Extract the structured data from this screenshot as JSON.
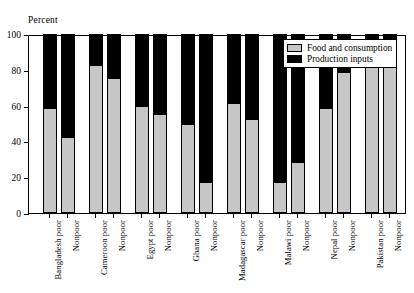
{
  "chart_data": {
    "type": "bar",
    "title": "",
    "subtitle": "",
    "ylabel": "Percent",
    "xlabel": "",
    "ylim": [
      0,
      100
    ],
    "yticks": [
      0,
      20,
      40,
      60,
      80,
      100
    ],
    "ytick_labels": [
      "0",
      "20",
      "40",
      "60",
      "80",
      "100"
    ],
    "grid": false,
    "stacked": true,
    "stack_total": 100,
    "legend_position": "top-right",
    "legend": [
      "Food and consumption",
      "Production inputs"
    ],
    "colors": {
      "food_and_consumption": "#c6c6c6",
      "production_inputs": "#000000",
      "axis": "#000000",
      "background": "#ffffff"
    },
    "groups": [
      "Bangladesh",
      "Cameroon",
      "Egypt",
      "Ghana",
      "Madagascar",
      "Malawi",
      "Nepal",
      "Pakistan"
    ],
    "categories": [
      "Bangladesh poor",
      "Nonpoor",
      "Cameroon poor",
      "Nonpoor",
      "Egypt poor",
      "Nonpoor",
      "Ghana poor",
      "Nonpoor",
      "Madagascar poor",
      "Nonpoor",
      "Malawi poor",
      "Nonpoor",
      "Nepal poor",
      "Nonpoor",
      "Pakistan poor",
      "Nonpoor"
    ],
    "series": [
      {
        "name": "Food and consumption",
        "color": "#c6c6c6",
        "values": [
          58,
          42,
          82,
          75,
          59,
          55,
          49,
          17,
          61,
          52,
          17,
          28,
          58,
          78,
          84,
          81
        ]
      },
      {
        "name": "Production inputs",
        "color": "#000000",
        "values": [
          42,
          58,
          18,
          25,
          41,
          45,
          51,
          83,
          39,
          48,
          83,
          72,
          42,
          22,
          16,
          19
        ]
      }
    ]
  },
  "legend": {
    "items": [
      {
        "label": "Food and consumption",
        "swatch": "food"
      },
      {
        "label": "Production inputs",
        "swatch": "prod"
      }
    ]
  }
}
